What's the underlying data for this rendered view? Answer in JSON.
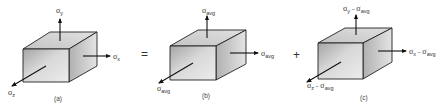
{
  "diagram": {
    "operators": {
      "equals": "=",
      "plus": "+"
    },
    "panels": [
      {
        "caption": "(a)",
        "labels": {
          "y": {
            "sigma": "σ",
            "sub": "y"
          },
          "x": {
            "sigma": "σ",
            "sub": "x"
          },
          "z": {
            "sigma": "σ",
            "sub": "z"
          }
        }
      },
      {
        "caption": "(b)",
        "labels": {
          "y": {
            "sigma": "σ",
            "sub": "avg"
          },
          "x": {
            "sigma": "σ",
            "sub": "avg"
          },
          "z": {
            "sigma": "σ",
            "sub": "avg"
          }
        }
      },
      {
        "caption": "(c)",
        "labels": {
          "y": {
            "sigma": "σ",
            "sub": "y",
            "minus": " − ",
            "sigma2": "σ",
            "sub2": "avg"
          },
          "x": {
            "sigma": "σ",
            "sub": "x",
            "minus": " − ",
            "sigma2": "σ",
            "sub2": "avg"
          },
          "z": {
            "sigma": "σ",
            "sub": "z",
            "minus": " − ",
            "sigma2": "σ",
            "sub2": "avg"
          }
        }
      }
    ],
    "colors": {
      "front_face_light": "#e6e6e6",
      "front_face_dark": "#a9a9a9",
      "top_face": "#cfcfcf",
      "side_face_light": "#b9b9b9",
      "side_face_dark": "#e2e2e2",
      "edge": "#222222"
    }
  }
}
